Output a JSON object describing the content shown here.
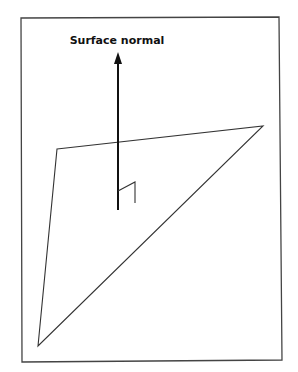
{
  "diagram": {
    "label": "Surface normal",
    "colors": {
      "stroke": "#333333",
      "arrow": "#111111",
      "frame": "#444444",
      "background": "#ffffff"
    },
    "frame": {
      "points": "21,18 279,17 282,360 22,362"
    },
    "plane": {
      "points": "57,149 263,126 38,346"
    },
    "normal_arrow": {
      "x": 118,
      "y_start": 210,
      "y_end": 53
    },
    "right_angle_marker": {
      "points": "118,191 135,182 135,203"
    }
  }
}
